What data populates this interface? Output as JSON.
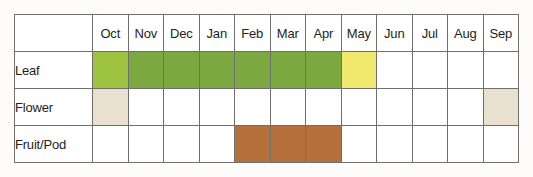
{
  "chart_data": {
    "type": "heatmap",
    "title": "",
    "xlabel": "",
    "ylabel": "",
    "legend_position": "none",
    "grid": true,
    "categories": [
      "Oct",
      "Nov",
      "Dec",
      "Jan",
      "Feb",
      "Mar",
      "Apr",
      "May",
      "Jun",
      "Jul",
      "Aug",
      "Sep"
    ],
    "row_labels": [
      "Leaf",
      "Flower",
      "Fruit/Pod"
    ],
    "corner_label": "",
    "colors": {
      "leaf_light_green": "#9cc23f",
      "leaf_green": "#7ba83f",
      "leaf_yellow": "#f0e96d",
      "flower_cream": "#e9e1d0",
      "fruit_brown": "#b5703c",
      "empty": "#ffffff",
      "border": "#6f6f6f",
      "background": "#fdfcfb",
      "text": "#231f20"
    },
    "series": [
      {
        "name": "Leaf",
        "values": [
          "#9cc23f",
          "#7ba83f",
          "#7ba83f",
          "#7ba83f",
          "#7ba83f",
          "#7ba83f",
          "#7ba83f",
          "#f0e96d",
          "#ffffff",
          "#ffffff",
          "#ffffff",
          "#ffffff"
        ],
        "active": [
          1,
          1,
          1,
          1,
          1,
          1,
          1,
          1,
          0,
          0,
          0,
          0
        ]
      },
      {
        "name": "Flower",
        "values": [
          "#e9e1d0",
          "#ffffff",
          "#ffffff",
          "#ffffff",
          "#ffffff",
          "#ffffff",
          "#ffffff",
          "#ffffff",
          "#ffffff",
          "#ffffff",
          "#ffffff",
          "#e9e1d0"
        ],
        "active": [
          1,
          0,
          0,
          0,
          0,
          0,
          0,
          0,
          0,
          0,
          0,
          1
        ]
      },
      {
        "name": "Fruit/Pod",
        "values": [
          "#ffffff",
          "#ffffff",
          "#ffffff",
          "#ffffff",
          "#b5703c",
          "#b5703c",
          "#b5703c",
          "#ffffff",
          "#ffffff",
          "#ffffff",
          "#ffffff",
          "#ffffff"
        ],
        "active": [
          0,
          0,
          0,
          0,
          1,
          1,
          1,
          0,
          0,
          0,
          0,
          0
        ]
      }
    ]
  }
}
